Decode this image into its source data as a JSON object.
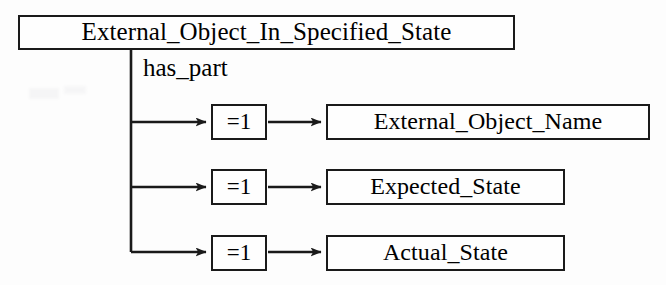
{
  "diagram": {
    "type": "entity-relationship",
    "root": {
      "label": "External_Object_In_Specified_State"
    },
    "relationship": {
      "label": "has_part"
    },
    "branches": [
      {
        "cardinality": "=1",
        "attribute": "External_Object_Name"
      },
      {
        "cardinality": "=1",
        "attribute": "Expected_State"
      },
      {
        "cardinality": "=1",
        "attribute": "Actual_State"
      }
    ],
    "colors": {
      "stroke": "#1a1a1a",
      "fill": "#fefefe",
      "background": "#fdfdfd"
    }
  }
}
